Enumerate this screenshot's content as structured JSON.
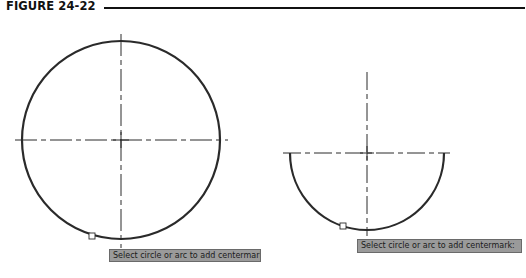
{
  "figure": {
    "title": "FIGURE 24-22"
  },
  "left_view": {
    "shape": "circle",
    "center": [
      121,
      140
    ],
    "radius": 99,
    "centermark": "dash-dot crosshair",
    "pick_box": [
      92,
      236
    ],
    "tooltip": "Select circle or arc to add centermark:"
  },
  "right_view": {
    "shape": "semicircular arc",
    "center": [
      367,
      153
    ],
    "radius": 77,
    "centermark": "dash-dot crosshair",
    "pick_box": [
      343,
      226
    ],
    "tooltip": "Select circle or arc to add centermark:"
  },
  "colors": {
    "line": "#2a2a2a",
    "tooltip_bg": "#9a9a9a",
    "tooltip_border": "#6a6a6a"
  }
}
